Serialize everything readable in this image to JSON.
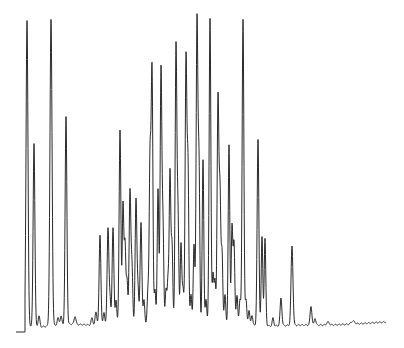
{
  "chart_data": {
    "type": "line",
    "title": "",
    "xlabel": "",
    "ylabel": "",
    "grid": false,
    "legend": null,
    "line_color": "#2a2a2a",
    "background": "#ffffff",
    "plot_px": {
      "x_start": 16,
      "x_end": 386,
      "baseline_y": 325
    },
    "baseline": [
      [
        16,
        332
      ],
      [
        25,
        332
      ],
      [
        25,
        325
      ],
      [
        40,
        327
      ],
      [
        70,
        324
      ],
      [
        90,
        325
      ],
      [
        120,
        325
      ],
      [
        160,
        324
      ],
      [
        200,
        324
      ],
      [
        240,
        325
      ],
      [
        270,
        326
      ],
      [
        300,
        325
      ],
      [
        330,
        325
      ],
      [
        355,
        324
      ],
      [
        370,
        323
      ],
      [
        386,
        322
      ]
    ],
    "peaks": [
      {
        "x": 27,
        "top": 20,
        "w": 2.2
      },
      {
        "x": 34,
        "top": 143,
        "w": 2
      },
      {
        "x": 39,
        "top": 316,
        "w": 2
      },
      {
        "x": 51,
        "top": 20,
        "w": 2.4
      },
      {
        "x": 58,
        "top": 318,
        "w": 2
      },
      {
        "x": 61,
        "top": 316,
        "w": 2
      },
      {
        "x": 66,
        "top": 117,
        "w": 2
      },
      {
        "x": 75,
        "top": 316,
        "w": 2
      },
      {
        "x": 92,
        "top": 318,
        "w": 2
      },
      {
        "x": 96,
        "top": 312,
        "w": 2
      },
      {
        "x": 100,
        "top": 235,
        "w": 2
      },
      {
        "x": 104,
        "top": 312,
        "w": 1.8
      },
      {
        "x": 108,
        "top": 228,
        "w": 2
      },
      {
        "x": 110,
        "top": 300,
        "w": 1.8
      },
      {
        "x": 113,
        "top": 228,
        "w": 2
      },
      {
        "x": 116,
        "top": 300,
        "w": 1.8
      },
      {
        "x": 120,
        "top": 130,
        "w": 2
      },
      {
        "x": 123,
        "top": 204,
        "w": 1.8
      },
      {
        "x": 125,
        "top": 245,
        "w": 1.8
      },
      {
        "x": 127,
        "top": 280,
        "w": 1.8
      },
      {
        "x": 130,
        "top": 190,
        "w": 2
      },
      {
        "x": 132,
        "top": 270,
        "w": 1.8
      },
      {
        "x": 136,
        "top": 200,
        "w": 2
      },
      {
        "x": 138,
        "top": 290,
        "w": 1.8
      },
      {
        "x": 141,
        "top": 222,
        "w": 2
      },
      {
        "x": 144,
        "top": 300,
        "w": 1.8
      },
      {
        "x": 148,
        "top": 290,
        "w": 1.8
      },
      {
        "x": 150,
        "top": 163,
        "w": 1.8
      },
      {
        "x": 152,
        "top": 68,
        "w": 2
      },
      {
        "x": 155,
        "top": 290,
        "w": 1.8
      },
      {
        "x": 158,
        "top": 190,
        "w": 1.8
      },
      {
        "x": 161,
        "top": 69,
        "w": 2
      },
      {
        "x": 163,
        "top": 230,
        "w": 1.8
      },
      {
        "x": 166,
        "top": 290,
        "w": 1.8
      },
      {
        "x": 168,
        "top": 280,
        "w": 1.8
      },
      {
        "x": 170,
        "top": 173,
        "w": 1.8
      },
      {
        "x": 172,
        "top": 245,
        "w": 1.8
      },
      {
        "x": 176,
        "top": 46,
        "w": 2
      },
      {
        "x": 178,
        "top": 220,
        "w": 1.8
      },
      {
        "x": 181,
        "top": 244,
        "w": 1.8
      },
      {
        "x": 183,
        "top": 290,
        "w": 1.8
      },
      {
        "x": 186,
        "top": 57,
        "w": 2
      },
      {
        "x": 188,
        "top": 172,
        "w": 1.8
      },
      {
        "x": 191,
        "top": 295,
        "w": 1.8
      },
      {
        "x": 194,
        "top": 245,
        "w": 1.8
      },
      {
        "x": 197,
        "top": 19,
        "w": 2
      },
      {
        "x": 199,
        "top": 170,
        "w": 1.8
      },
      {
        "x": 203,
        "top": 160,
        "w": 1.8
      },
      {
        "x": 206,
        "top": 300,
        "w": 1.8
      },
      {
        "x": 210,
        "top": 19,
        "w": 2
      },
      {
        "x": 213,
        "top": 275,
        "w": 1.8
      },
      {
        "x": 215,
        "top": 280,
        "w": 1.8
      },
      {
        "x": 218,
        "top": 97,
        "w": 2
      },
      {
        "x": 220,
        "top": 198,
        "w": 1.8
      },
      {
        "x": 222,
        "top": 252,
        "w": 1.8
      },
      {
        "x": 225,
        "top": 295,
        "w": 1.8
      },
      {
        "x": 229,
        "top": 145,
        "w": 1.8
      },
      {
        "x": 232,
        "top": 227,
        "w": 1.8
      },
      {
        "x": 234,
        "top": 243,
        "w": 1.8
      },
      {
        "x": 237,
        "top": 295,
        "w": 1.8
      },
      {
        "x": 240,
        "top": 300,
        "w": 1.8
      },
      {
        "x": 243,
        "top": 20,
        "w": 2
      },
      {
        "x": 246,
        "top": 300,
        "w": 1.8
      },
      {
        "x": 249,
        "top": 310,
        "w": 1.8
      },
      {
        "x": 252,
        "top": 315,
        "w": 1.8
      },
      {
        "x": 258,
        "top": 140,
        "w": 2
      },
      {
        "x": 262,
        "top": 237,
        "w": 1.8
      },
      {
        "x": 265,
        "top": 239,
        "w": 1.8
      },
      {
        "x": 273,
        "top": 318,
        "w": 1.8
      },
      {
        "x": 281,
        "top": 298,
        "w": 2
      },
      {
        "x": 292,
        "top": 246,
        "w": 2.2
      },
      {
        "x": 311,
        "top": 306,
        "w": 2
      },
      {
        "x": 315,
        "top": 318,
        "w": 1.8
      },
      {
        "x": 328,
        "top": 322,
        "w": 3
      },
      {
        "x": 353,
        "top": 321,
        "w": 4
      }
    ]
  }
}
